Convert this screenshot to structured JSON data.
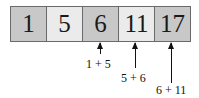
{
  "array": {
    "cells": [
      {
        "value": "1",
        "color": "#c8c8c8"
      },
      {
        "value": "5",
        "color": "#ebebeb"
      },
      {
        "value": "6",
        "color": "#c8c8c8"
      },
      {
        "value": "11",
        "color": "#ebebeb"
      },
      {
        "value": "17",
        "color": "#c8c8c8"
      }
    ]
  },
  "annotations": [
    {
      "label": "1 + 5",
      "target_index": 2
    },
    {
      "label": "5 + 6",
      "target_index": 3
    },
    {
      "label": "6 + 11",
      "target_index": 4
    }
  ]
}
